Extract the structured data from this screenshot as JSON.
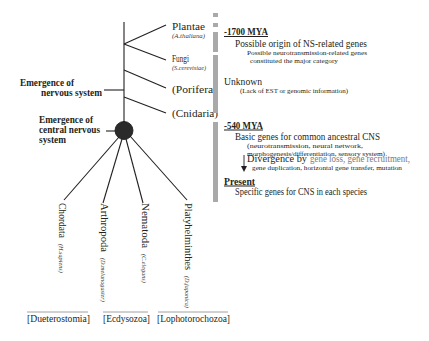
{
  "colors": {
    "text": "#231f20",
    "timeline_bar": "#a9a9a9",
    "highlight_gray": "#7a7a7a",
    "cns_node": "#2b2b2b"
  },
  "tree": {
    "outgroups": [
      {
        "name": "Plantae",
        "species": "(A.thaliana)"
      },
      {
        "name": "Fungi",
        "species": "(S.cerevisiae)"
      },
      {
        "name": "(Porifera)"
      },
      {
        "name": "(Cnidaria)"
      }
    ],
    "events": {
      "nervous_system": {
        "line1": "Emergence of",
        "line2": "nervous system"
      },
      "cns": {
        "line1": "Emergence of",
        "line2": "central nervous",
        "line3": "system"
      }
    },
    "bilaterians": [
      {
        "name": "Chordata",
        "species": "(H.sapiens)"
      },
      {
        "name": "Arthropoda",
        "species": "(D.melanogaster)"
      },
      {
        "name": "Nematoda",
        "species": "(C.elegans)"
      },
      {
        "name": "Platyhelminthes",
        "species": "(D.japonica)"
      }
    ],
    "superclades": [
      "[Dueterostomia]",
      "[Ecdysozoa]",
      "[Lophotorochozoa]"
    ]
  },
  "timeline": {
    "era_1700": {
      "heading": "-1700 MYA",
      "title": "Possible origin of NS-related genes",
      "note_line1": "Possible neurotransmission-related genes",
      "note_line2": "constituted the major category"
    },
    "unknown": {
      "title": "Unknown",
      "note": "(Lack of EST or genomic information)"
    },
    "era_540": {
      "heading": "-540 MYA",
      "title": "Basic genes for common ancestral CNS",
      "note_line1": "(neurotransmission, neural network,",
      "note_line2": "morphogenesis/differentiation, sensory system)",
      "divergence_label": "Divergence by",
      "divergence_highlight": "gene loss, gene recruitment,",
      "divergence_note": "gene duplication, horizontal gene transfer, mutation"
    },
    "present": {
      "heading": "Present",
      "title": "Specific genes for CNS in each species"
    }
  }
}
